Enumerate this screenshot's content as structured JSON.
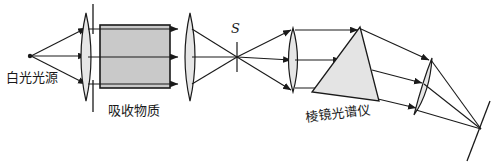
{
  "figure": {
    "background_color": "#ffffff",
    "line_color": "#1a1a1a",
    "cell_fill": "#c9c9c9",
    "lens_fill": "#e6e6e6",
    "prism_fill": "#e4e4e4"
  },
  "labels": {
    "source": "白光光源",
    "absorber": "吸收物质",
    "spectrometer": "棱镜光谱仪",
    "slit": "S"
  },
  "components": {
    "source": {
      "name": "白光光源",
      "x": 30,
      "y": 56
    },
    "lens1": {
      "name": "collimating-lens",
      "cx": 86,
      "cy": 57,
      "half_height": 44
    },
    "cell": {
      "name": "吸收物质",
      "x": 100,
      "y": 25,
      "width": 70,
      "height": 63
    },
    "lens2": {
      "name": "focusing-lens",
      "cx": 190,
      "cy": 57,
      "half_height": 44
    },
    "slit": {
      "name": "S",
      "x": 237,
      "y": 57
    },
    "lens3": {
      "name": "collimating-lens-2",
      "cx": 293,
      "cy": 60,
      "half_height": 32
    },
    "prism": {
      "name": "棱镜光谱仪",
      "apex_x": 360,
      "apex_y": 27
    },
    "lens4": {
      "name": "camera-lens",
      "cx": 424,
      "cy": 85
    },
    "screen": {
      "name": "screen",
      "x1": 487,
      "y1": 100,
      "x2": 466,
      "y2": 160
    }
  },
  "ray_paths": {
    "count_from_source": 3,
    "count_through_prism": 3,
    "arrow_marker": "arrowhead"
  }
}
